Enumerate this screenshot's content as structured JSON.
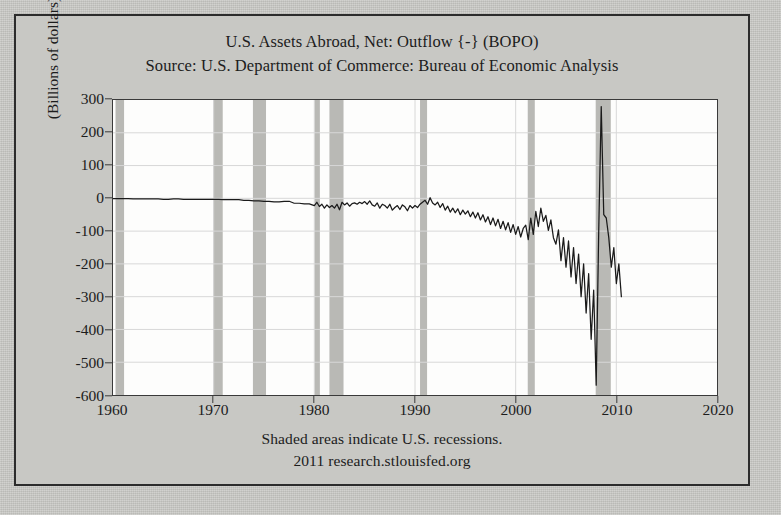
{
  "figure": {
    "title_line1": "U.S. Assets Abroad, Net: Outflow {-} (BOPO)",
    "title_line2": "Source: U.S. Department of Commerce: Bureau of Economic Analysis",
    "caption_line1": "Shaded areas indicate U.S. recessions.",
    "caption_line2": "2011 research.stlouisfed.org",
    "ylabel": "(Billions of dollars)",
    "colors": {
      "page_background": "#c9c9c5",
      "plot_background": "#fdfdfc",
      "frame_border": "#2c2c2c",
      "line": "#1a1a1a",
      "recession_band": "#b9b9b5",
      "gridline": "#d8d8d8",
      "text": "#1c1c1c"
    }
  },
  "chart_data": {
    "type": "line",
    "title": "U.S. Assets Abroad, Net: Outflow {-} (BOPO)",
    "subtitle": "Source: U.S. Department of Commerce: Bureau of Economic Analysis",
    "xlabel": "",
    "ylabel": "(Billions of dollars)",
    "xlim": [
      1960,
      2020
    ],
    "ylim": [
      -600,
      300
    ],
    "xticks": [
      1960,
      1970,
      1980,
      1990,
      2000,
      2010,
      2020
    ],
    "xtick_labels": [
      "1960",
      "1970",
      "1980",
      "1990",
      "2000",
      "2010",
      "2020"
    ],
    "yticks": [
      300,
      200,
      100,
      0,
      -100,
      -200,
      -300,
      -400,
      -500,
      -600
    ],
    "ytick_labels": [
      "300",
      "200",
      "100",
      "0",
      "-100",
      "-200",
      "-300",
      "-400",
      "-500",
      "-600"
    ],
    "grid": true,
    "legend": false,
    "frequency": "quarterly",
    "units": "Billions of dollars",
    "series": [
      {
        "name": "U.S. Assets Abroad, Net: Outflow {-} (BOPO)",
        "color": "#1a1a1a",
        "x": [
          1960.0,
          1960.5,
          1961.0,
          1961.5,
          1962.0,
          1962.5,
          1963.0,
          1963.5,
          1964.0,
          1964.5,
          1965.0,
          1965.5,
          1966.0,
          1966.5,
          1967.0,
          1967.5,
          1968.0,
          1968.5,
          1969.0,
          1969.5,
          1970.0,
          1970.5,
          1971.0,
          1971.5,
          1972.0,
          1972.5,
          1973.0,
          1973.5,
          1974.0,
          1974.5,
          1975.0,
          1975.5,
          1976.0,
          1976.5,
          1977.0,
          1977.5,
          1978.0,
          1978.5,
          1979.0,
          1979.5,
          1980.0,
          1980.25,
          1980.5,
          1980.75,
          1981.0,
          1981.25,
          1981.5,
          1981.75,
          1982.0,
          1982.25,
          1982.5,
          1982.75,
          1983.0,
          1983.25,
          1983.5,
          1983.75,
          1984.0,
          1984.25,
          1984.5,
          1984.75,
          1985.0,
          1985.25,
          1985.5,
          1985.75,
          1986.0,
          1986.25,
          1986.5,
          1986.75,
          1987.0,
          1987.25,
          1987.5,
          1987.75,
          1988.0,
          1988.25,
          1988.5,
          1988.75,
          1989.0,
          1989.25,
          1989.5,
          1989.75,
          1990.0,
          1990.25,
          1990.5,
          1990.75,
          1991.0,
          1991.25,
          1991.5,
          1991.75,
          1992.0,
          1992.25,
          1992.5,
          1992.75,
          1993.0,
          1993.25,
          1993.5,
          1993.75,
          1994.0,
          1994.25,
          1994.5,
          1994.75,
          1995.0,
          1995.25,
          1995.5,
          1995.75,
          1996.0,
          1996.25,
          1996.5,
          1996.75,
          1997.0,
          1997.25,
          1997.5,
          1997.75,
          1998.0,
          1998.25,
          1998.5,
          1998.75,
          1999.0,
          1999.25,
          1999.5,
          1999.75,
          2000.0,
          2000.25,
          2000.5,
          2000.75,
          2001.0,
          2001.25,
          2001.5,
          2001.75,
          2002.0,
          2002.25,
          2002.5,
          2002.75,
          2003.0,
          2003.25,
          2003.5,
          2003.75,
          2004.0,
          2004.25,
          2004.5,
          2004.75,
          2005.0,
          2005.25,
          2005.5,
          2005.75,
          2006.0,
          2006.25,
          2006.5,
          2006.75,
          2007.0,
          2007.25,
          2007.5,
          2007.75,
          2008.0,
          2008.25,
          2008.5,
          2008.75,
          2009.0,
          2009.25,
          2009.5,
          2009.75,
          2010.0,
          2010.25,
          2010.5
        ],
        "y": [
          -1,
          -1,
          -1,
          -1,
          -2,
          -2,
          -2,
          -2,
          -2,
          -2,
          -3,
          -3,
          -2,
          -2,
          -3,
          -3,
          -3,
          -3,
          -3,
          -3,
          -3,
          -3,
          -4,
          -4,
          -4,
          -4,
          -6,
          -6,
          -8,
          -8,
          -9,
          -9,
          -11,
          -11,
          -9,
          -9,
          -15,
          -15,
          -17,
          -17,
          -22,
          -12,
          -25,
          -18,
          -30,
          -20,
          -28,
          -22,
          -30,
          -18,
          -35,
          -12,
          -20,
          -14,
          -24,
          -16,
          -14,
          -18,
          -12,
          -16,
          -10,
          -18,
          -8,
          -20,
          -24,
          -14,
          -30,
          -18,
          -22,
          -30,
          -18,
          -36,
          -28,
          -22,
          -34,
          -20,
          -26,
          -38,
          -22,
          -30,
          -22,
          -28,
          -18,
          -12,
          -6,
          -18,
          2,
          -14,
          -20,
          -12,
          -28,
          -16,
          -36,
          -24,
          -42,
          -30,
          -44,
          -32,
          -50,
          -36,
          -48,
          -38,
          -56,
          -42,
          -60,
          -44,
          -66,
          -50,
          -72,
          -56,
          -80,
          -60,
          -84,
          -64,
          -92,
          -70,
          -96,
          -74,
          -104,
          -80,
          -110,
          -86,
          -118,
          -92,
          -82,
          -126,
          -60,
          -110,
          -40,
          -86,
          -30,
          -70,
          -52,
          -98,
          -66,
          -120,
          -140,
          -96,
          -190,
          -120,
          -210,
          -130,
          -240,
          -150,
          -260,
          -170,
          -300,
          -200,
          -350,
          -230,
          -430,
          -280,
          -570,
          -100,
          280,
          -50,
          -60,
          -120,
          -210,
          -150,
          -260,
          -200,
          -300
        ]
      }
    ],
    "recessions": [
      {
        "start": 1960.25,
        "end": 1961.1
      },
      {
        "start": 1969.95,
        "end": 1970.9
      },
      {
        "start": 1973.9,
        "end": 1975.2
      },
      {
        "start": 1980.0,
        "end": 1980.55
      },
      {
        "start": 1981.5,
        "end": 1982.9
      },
      {
        "start": 1990.5,
        "end": 1991.2
      },
      {
        "start": 2001.2,
        "end": 2001.9
      },
      {
        "start": 2007.95,
        "end": 2009.45
      }
    ]
  }
}
